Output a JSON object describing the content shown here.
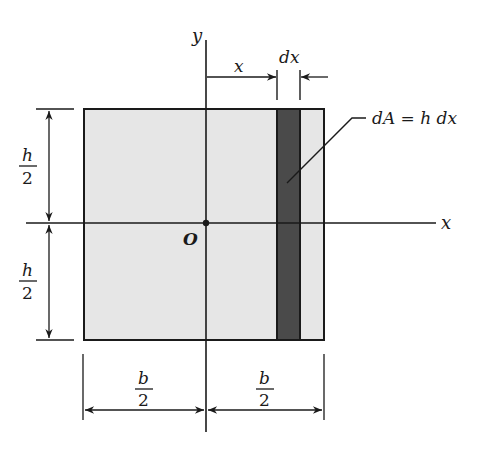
{
  "diagram": {
    "colors": {
      "area_fill": "#e6e6e6",
      "strip_fill": "#4a4a4a",
      "line": "#1a1a1a",
      "background": "#ffffff"
    },
    "axes": {
      "x_label": "x",
      "y_label": "y",
      "origin_label": "O"
    },
    "dimensions": {
      "strip_distance_label": "x",
      "strip_width_label": "dx",
      "half_height": {
        "numerator": "h",
        "denominator": "2"
      },
      "half_width": {
        "numerator": "b",
        "denominator": "2"
      }
    },
    "annotation": {
      "strip_area": "dA = h dx"
    }
  }
}
